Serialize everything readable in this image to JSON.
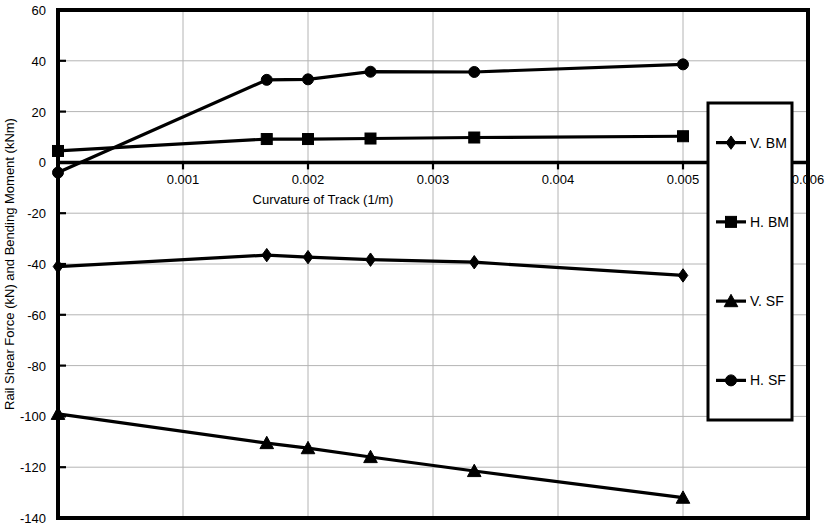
{
  "chart_data": {
    "type": "line",
    "title": "",
    "xlabel": "Curvature of Track (1/m)",
    "ylabel": "Rail Shear Force (kN) and Bending Moment (kNm)",
    "xlim": [
      0,
      0.006
    ],
    "ylim": [
      -140,
      60
    ],
    "xticks": [
      0.001,
      0.002,
      0.003,
      0.004,
      0.005,
      0.006
    ],
    "xtick_labels": [
      "0.001",
      "0.002",
      "0.003",
      "0.004",
      "0.005",
      "0.006"
    ],
    "yticks": [
      60,
      40,
      20,
      0,
      -20,
      -40,
      -60,
      -80,
      -100,
      -120,
      -140
    ],
    "ytick_labels": [
      "60",
      "40",
      "20",
      "0",
      "-20",
      "-40",
      "-60",
      "-80",
      "-100",
      "-120",
      "-140"
    ],
    "grid": true,
    "legend_position": "right-inside",
    "x": [
      0,
      0.00167,
      0.002,
      0.0025,
      0.00333,
      0.005
    ],
    "series": [
      {
        "name": "V. BM",
        "marker": "diamond",
        "color": "#000000",
        "values": [
          -41.0,
          -36.5,
          -37.3,
          -38.3,
          -39.3,
          -44.5
        ]
      },
      {
        "name": "H. BM",
        "marker": "square",
        "color": "#000000",
        "values": [
          4.5,
          9.2,
          9.2,
          9.4,
          9.8,
          10.3
        ]
      },
      {
        "name": "V. SF",
        "marker": "triangle",
        "color": "#000000",
        "values": [
          -99.0,
          -110.5,
          -112.5,
          -116.0,
          -121.5,
          -132.0
        ]
      },
      {
        "name": "H. SF",
        "marker": "circle",
        "color": "#000000",
        "values": [
          -4.0,
          32.5,
          32.7,
          35.7,
          35.6,
          38.6
        ]
      }
    ]
  },
  "legend": {
    "entries": [
      {
        "label": "V. BM",
        "marker": "diamond"
      },
      {
        "label": "H. BM",
        "marker": "square"
      },
      {
        "label": "V. SF",
        "marker": "triangle"
      },
      {
        "label": "H. SF",
        "marker": "circle"
      }
    ]
  }
}
